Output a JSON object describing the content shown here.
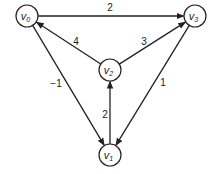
{
  "diagram": {
    "type": "directed-weighted-graph",
    "nodes": [
      {
        "id": "v0",
        "label": "v",
        "sub": "0",
        "x": 27,
        "y": 16
      },
      {
        "id": "v1",
        "label": "v",
        "sub": "1",
        "x": 110,
        "y": 155
      },
      {
        "id": "v2",
        "label": "v",
        "sub": "2",
        "x": 110,
        "y": 70
      },
      {
        "id": "v3",
        "label": "v",
        "sub": "3",
        "x": 195,
        "y": 16
      }
    ],
    "edges": [
      {
        "from": "v0",
        "to": "v3",
        "weight": "2",
        "lx": 110,
        "ly": 11
      },
      {
        "from": "v2",
        "to": "v0",
        "weight": "4",
        "lx": 76,
        "ly": 45
      },
      {
        "from": "v2",
        "to": "v3",
        "weight": "3",
        "lx": 144,
        "ly": 45
      },
      {
        "from": "v0",
        "to": "v1",
        "weight": "−1",
        "lx": 56,
        "ly": 87
      },
      {
        "from": "v1",
        "to": "v2",
        "weight": "2",
        "lx": 105,
        "ly": 118
      },
      {
        "from": "v3",
        "to": "v1",
        "weight": "1",
        "lx": 163,
        "ly": 86
      }
    ],
    "node_radius": 11,
    "colors": {
      "stroke": "#222222",
      "fill": "#ffffff"
    }
  }
}
